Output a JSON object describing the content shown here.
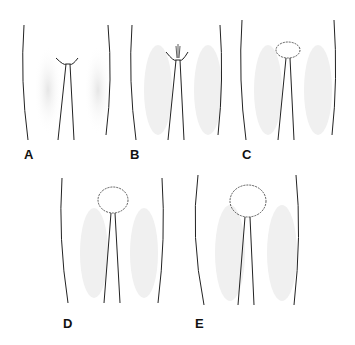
{
  "figure": {
    "panels": [
      {
        "label": "A",
        "stage": 1
      },
      {
        "label": "B",
        "stage": 2
      },
      {
        "label": "C",
        "stage": 3
      },
      {
        "label": "D",
        "stage": 4
      },
      {
        "label": "E",
        "stage": 5
      }
    ]
  },
  "colors": {
    "line": "#222222",
    "shade": "#d8d8d8",
    "background": "#ffffff"
  }
}
